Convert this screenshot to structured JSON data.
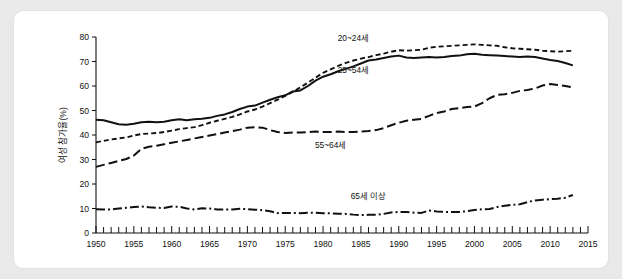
{
  "figure": {
    "background": "#e9e9e9",
    "panel_background": "#ffffff",
    "ink_color": "#111111"
  },
  "chart_data": {
    "type": "line",
    "title": "",
    "xlabel": "",
    "ylabel": "여성 참가율(%)",
    "xlim": [
      1950,
      2015
    ],
    "ylim": [
      0,
      80
    ],
    "grid": false,
    "legend_position": "inline-annotations",
    "y_ticks": [
      0,
      10,
      20,
      30,
      40,
      50,
      60,
      70,
      80
    ],
    "x_ticks_major": [
      1950,
      1955,
      1960,
      1965,
      1970,
      1975,
      1980,
      1985,
      1990,
      1995,
      2000,
      2005,
      2010,
      2015
    ],
    "x_tick_labels": [
      "1950",
      "1955",
      "1960",
      "1965",
      "1970",
      "1975",
      "1980",
      "1985",
      "1990",
      "1995",
      "2000",
      "2005",
      "2010",
      "2015"
    ],
    "x_minor_tick_step": 1,
    "x": [
      1950,
      1951,
      1952,
      1953,
      1954,
      1955,
      1956,
      1957,
      1958,
      1959,
      1960,
      1961,
      1962,
      1963,
      1964,
      1965,
      1966,
      1967,
      1968,
      1969,
      1970,
      1971,
      1972,
      1973,
      1974,
      1975,
      1976,
      1977,
      1978,
      1979,
      1980,
      1981,
      1982,
      1983,
      1984,
      1985,
      1986,
      1987,
      1988,
      1989,
      1990,
      1991,
      1992,
      1993,
      1994,
      1995,
      1996,
      1997,
      1998,
      1999,
      2000,
      2001,
      2002,
      2003,
      2004,
      2005,
      2006,
      2007,
      2008,
      2009,
      2010,
      2011,
      2012,
      2013
    ],
    "series": [
      {
        "name": "20~24세",
        "label": "20~24세",
        "linestyle": "short-dash",
        "dasharray": "5,3",
        "linewidth": 1.9,
        "label_anchor_year": 1984,
        "label_anchor_value": 78.5,
        "values": [
          37.0,
          37.6,
          38.2,
          38.6,
          39.0,
          39.8,
          40.4,
          40.6,
          40.8,
          41.2,
          41.8,
          42.4,
          42.8,
          43.2,
          44.0,
          45.0,
          45.8,
          46.6,
          47.4,
          48.4,
          49.6,
          50.4,
          51.6,
          53.0,
          54.4,
          56.0,
          57.6,
          59.4,
          61.4,
          63.4,
          65.4,
          66.8,
          68.2,
          69.4,
          70.4,
          71.2,
          71.8,
          72.6,
          73.2,
          74.0,
          74.6,
          74.4,
          74.6,
          74.8,
          75.6,
          76.0,
          76.2,
          76.4,
          76.6,
          76.8,
          77.0,
          76.8,
          76.6,
          76.4,
          75.8,
          75.4,
          75.2,
          75.0,
          74.8,
          74.4,
          74.2,
          74.0,
          74.2,
          74.4
        ]
      },
      {
        "name": "25~54세",
        "label": "25~54세",
        "linestyle": "solid",
        "dasharray": "",
        "linewidth": 2.0,
        "label_anchor_year": 1984,
        "label_anchor_value": 65.5,
        "values": [
          46.2,
          46.0,
          45.2,
          44.4,
          44.2,
          44.6,
          45.2,
          45.4,
          45.2,
          45.4,
          46.0,
          46.4,
          46.0,
          46.4,
          46.6,
          47.0,
          47.8,
          48.4,
          49.4,
          50.6,
          51.6,
          52.0,
          53.2,
          54.4,
          55.4,
          56.2,
          57.8,
          58.2,
          60.0,
          62.2,
          63.8,
          64.8,
          66.0,
          67.0,
          68.0,
          69.2,
          70.4,
          70.8,
          71.4,
          72.0,
          72.4,
          71.6,
          71.4,
          71.6,
          71.8,
          71.6,
          71.8,
          72.2,
          72.4,
          73.0,
          73.2,
          72.8,
          72.6,
          72.4,
          72.2,
          72.0,
          71.8,
          72.0,
          71.8,
          71.2,
          70.6,
          70.2,
          69.4,
          68.4
        ]
      },
      {
        "name": "55~64세",
        "label": "55~64세",
        "linestyle": "long-dash",
        "dasharray": "9,4",
        "linewidth": 2.0,
        "label_anchor_year": 1981,
        "label_anchor_value": 34.5,
        "values": [
          27.0,
          27.8,
          28.6,
          29.4,
          30.2,
          31.6,
          34.4,
          35.2,
          35.6,
          36.2,
          36.8,
          37.4,
          38.0,
          38.6,
          39.2,
          39.8,
          40.4,
          41.0,
          41.6,
          42.2,
          43.0,
          43.2,
          43.0,
          42.0,
          41.2,
          40.8,
          41.0,
          41.0,
          41.2,
          41.4,
          41.2,
          41.2,
          41.4,
          41.2,
          41.2,
          41.4,
          41.6,
          42.0,
          42.8,
          44.0,
          45.0,
          45.8,
          46.2,
          46.6,
          47.8,
          49.0,
          49.6,
          50.6,
          51.0,
          51.4,
          51.6,
          53.0,
          55.0,
          56.4,
          56.6,
          57.2,
          58.0,
          58.4,
          59.0,
          60.2,
          60.8,
          60.4,
          60.0,
          59.4
        ]
      },
      {
        "name": "65세 이상",
        "label": "65세 이상",
        "linestyle": "dash-dot",
        "dasharray": "9,3,2,3",
        "linewidth": 2.0,
        "label_anchor_year": 1986,
        "label_anchor_value": 13.8,
        "values": [
          9.7,
          9.6,
          9.6,
          10.0,
          10.3,
          10.6,
          10.8,
          10.5,
          10.3,
          10.2,
          10.8,
          10.7,
          10.0,
          9.6,
          10.1,
          10.0,
          9.6,
          9.6,
          9.6,
          9.9,
          9.7,
          9.5,
          9.3,
          8.9,
          8.1,
          8.2,
          8.2,
          8.1,
          8.3,
          8.3,
          8.1,
          8.0,
          7.9,
          7.8,
          7.5,
          7.3,
          7.4,
          7.4,
          7.8,
          8.4,
          8.6,
          8.6,
          8.3,
          8.2,
          9.2,
          8.8,
          8.6,
          8.6,
          8.6,
          8.9,
          9.4,
          9.7,
          9.8,
          10.6,
          11.1,
          11.5,
          11.7,
          12.6,
          13.3,
          13.6,
          13.8,
          14.0,
          14.4,
          15.5
        ]
      }
    ]
  }
}
